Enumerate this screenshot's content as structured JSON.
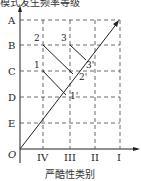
{
  "diagram": {
    "title_partial": "模式发生频率等级",
    "y_axis_label": "模式发生频率等级",
    "x_axis_label": "严酷性类别",
    "origin_label": "O",
    "y_ticks": [
      "A",
      "B",
      "C",
      "D",
      "E"
    ],
    "x_ticks": [
      "IV",
      "III",
      "II",
      "I"
    ],
    "points": [
      "1",
      "2",
      "3"
    ],
    "primed_points": [
      "1'",
      "2'",
      "3'"
    ],
    "line_color": "#222222",
    "grid_style": "dashed"
  }
}
